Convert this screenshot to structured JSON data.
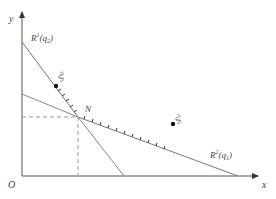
{
  "diagram": {
    "axes": {
      "x_label": "x",
      "y_label": "y",
      "origin_label": "O"
    },
    "curves": [
      {
        "name": "R1",
        "label_main": "R",
        "label_sup": "1",
        "label_arg": "(q",
        "label_sub": "2",
        "label_close": ")"
      },
      {
        "name": "R2",
        "label_main": "R",
        "label_sup": "2",
        "label_arg": "(q",
        "label_sub": "1",
        "label_close": ")"
      }
    ],
    "points": [
      {
        "name": "N",
        "label": "N"
      },
      {
        "name": "S0",
        "label_main": "S",
        "label_sup": "0"
      },
      {
        "name": "S1",
        "label_main": "S",
        "label_sup": "1"
      }
    ],
    "colors": {
      "axis": "#555555",
      "line": "#777777",
      "dashed": "#888888",
      "dot": "#111111"
    }
  }
}
